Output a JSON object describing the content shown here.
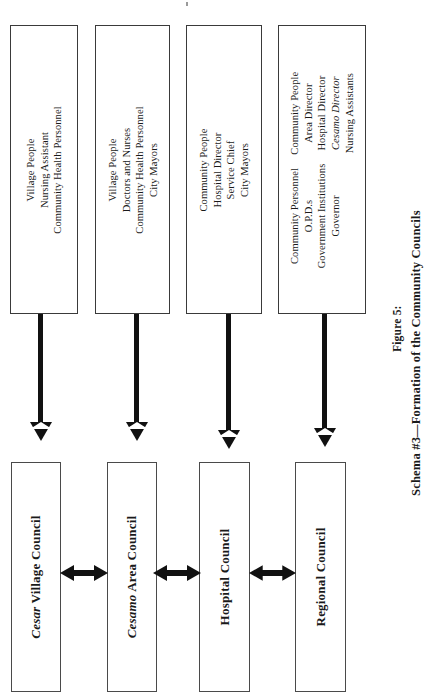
{
  "figure": {
    "caption_label": "Figure 5:",
    "caption_title": "Schema #3—Formation of the Community Councils",
    "orientation": "rotated-90-ccw"
  },
  "colors": {
    "box_border": "#3a3a3a",
    "council_border": "#4a4a4a",
    "arrow": "#111111",
    "background": "#ffffff",
    "text": "#1a1a1a"
  },
  "source_boxes": [
    {
      "id": "source-box-1",
      "columns": [
        {
          "lines": [
            "Village People",
            "Nursing Assistant",
            "Community Health Personnel"
          ]
        }
      ]
    },
    {
      "id": "source-box-2",
      "columns": [
        {
          "lines": [
            "Village People",
            "Doctors and Nurses",
            "Community Health Personnel",
            "City Mayors"
          ]
        }
      ]
    },
    {
      "id": "source-box-3",
      "columns": [
        {
          "lines": [
            "Community People",
            "Hospital Director",
            "Service Chief",
            "City Mayors"
          ]
        }
      ]
    },
    {
      "id": "source-box-4",
      "columns": [
        {
          "lines": [
            "Community People",
            "Area Director",
            "Hospital Director",
            "Cesamo Director",
            "Nursing Assistants"
          ],
          "italic_lines": [
            "Cesamo Director"
          ]
        },
        {
          "lines": [
            "Community Personnel",
            "O.P.D.s",
            "Government Institutions",
            "Governor"
          ]
        }
      ]
    }
  ],
  "councils": [
    {
      "id": "council-cesar-village",
      "italic_prefix": "Cesar",
      "rest": " Village Council",
      "full": "Cesar Village Council"
    },
    {
      "id": "council-cesamo-area",
      "italic_prefix": "Cesamo",
      "rest": " Area Council",
      "full": "Cesamo Area Council"
    },
    {
      "id": "council-hospital",
      "italic_prefix": "",
      "rest": "Hospital Council",
      "full": "Hospital Council"
    },
    {
      "id": "council-regional",
      "italic_prefix": "",
      "rest": "Regional Council",
      "full": "Regional Council"
    }
  ],
  "connectors": {
    "down_arrows": 4,
    "bidirectional_arrows": 3,
    "down_arrow_description": "vertical arrow from each source box into the council box below it",
    "bidirectional_arrow_description": "double-headed arrow linking adjacent councils"
  }
}
